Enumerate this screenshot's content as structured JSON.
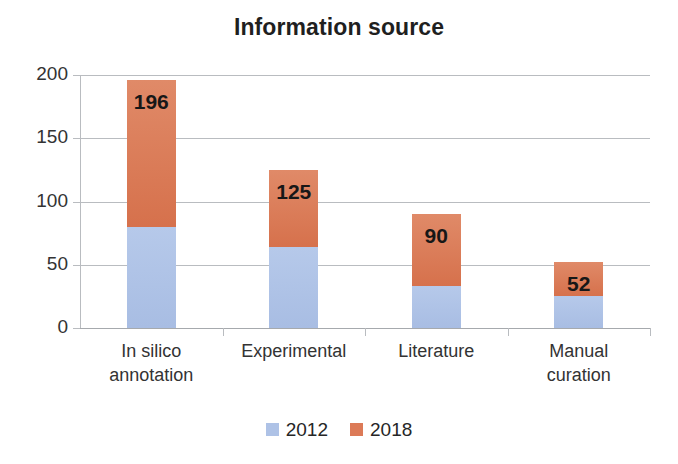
{
  "chart_data": {
    "type": "bar",
    "subtype": "stacked-column",
    "title": "Information source",
    "xlabel": "",
    "ylabel": "",
    "ylim": [
      0,
      200
    ],
    "yticks": [
      0,
      50,
      100,
      150,
      200
    ],
    "ytick_labels": [
      "0",
      "50",
      "100",
      "150",
      "200"
    ],
    "grid": true,
    "legend_position": "bottom-center",
    "categories": [
      "In silico annotation",
      "Experimental",
      "Literature",
      "Manual curation"
    ],
    "category_lines": [
      [
        "In silico",
        "annotation"
      ],
      [
        "Experimental"
      ],
      [
        "Literature"
      ],
      [
        "Manual",
        "curation"
      ]
    ],
    "series": [
      {
        "name": "2012",
        "color": "#aec2e6",
        "values": [
          80,
          64,
          33,
          25
        ]
      },
      {
        "name": "2018",
        "color": "#dc7a57",
        "values": [
          116,
          61,
          57,
          27
        ]
      }
    ],
    "totals": [
      196,
      125,
      90,
      52
    ],
    "total_labels": [
      "196",
      "125",
      "90",
      "52"
    ],
    "legend": [
      {
        "label": "2012",
        "color": "#aec2e6"
      },
      {
        "label": "2018",
        "color": "#dc7a57"
      }
    ]
  },
  "colors": {
    "series_2012": "#aec2e6",
    "series_2018": "#dc7a57",
    "gridline": "#b9bcc0",
    "text": "#262626",
    "title": "#1f1f1f",
    "background": "#ffffff"
  }
}
